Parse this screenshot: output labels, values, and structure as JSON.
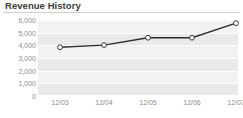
{
  "header": {
    "title": "Revenue History"
  },
  "axis": {
    "y_ticks": [
      "6,000",
      "5,000",
      "4,000",
      "3,000",
      "2,000",
      "1,000",
      "0"
    ],
    "x_ticks": [
      "12/03",
      "12/04",
      "12/05",
      "12/06",
      "12/07"
    ]
  },
  "style": {
    "line_color": "#2f2f2f",
    "marker_fill": "#ffffff",
    "marker_stroke": "#3a3a3a",
    "band_dark": "#e9e9e9",
    "band_light": "#f2f2f2",
    "gridline_color": "#ffffff",
    "title_color": "#3b3b3b",
    "tick_color": "#8d8d8d",
    "rule_color": "#cfcfcf"
  },
  "chart_data": {
    "type": "line",
    "title": "Revenue History",
    "xlabel": "",
    "ylabel": "",
    "categories": [
      "12/03",
      "12/04",
      "12/05",
      "12/06",
      "12/07"
    ],
    "values": [
      3850,
      4020,
      4600,
      4600,
      5750
    ],
    "series": [
      {
        "name": "Revenue",
        "values": [
          3850,
          4020,
          4600,
          4600,
          5750
        ]
      }
    ],
    "ylim": [
      0,
      6000
    ],
    "ytick_values": [
      0,
      1000,
      2000,
      3000,
      4000,
      5000,
      6000
    ],
    "grid": true,
    "legend": "none",
    "markers": "open-circle"
  }
}
